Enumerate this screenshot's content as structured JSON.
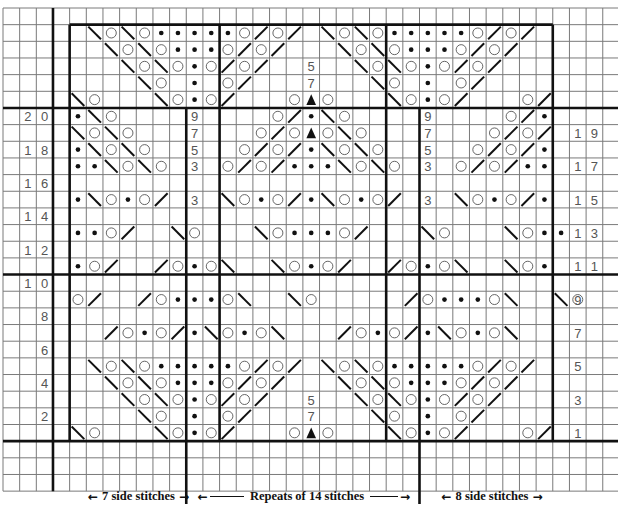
{
  "chart": {
    "cell_size": 16.66,
    "grid_origin_x": 3,
    "grid_origin_y": 8,
    "total_columns": 37,
    "total_rows": 29,
    "chart_col_start": 4,
    "chart_columns": 29,
    "chart_row_top": 1,
    "chart_rows": 26,
    "line_color": "#7a7a7a",
    "thick_line_color": "#111111",
    "symbol_color": "#111111",
    "label_color": "#555555",
    "symbol_legend": {
      ".": "empty",
      "o": "yarn-over",
      "*": "purl-dot",
      "\\": "left-slant-decrease",
      "/": "right-slant-decrease",
      "^": "triangle-double-decrease"
    },
    "rows": [
      {
        "row": 25,
        "cells": ".\\o\\o*****o/o/.\\o\\o*****o/o/."
      },
      {
        "row": 24,
        "cells": "..\\o\\o***o/o/...\\o\\o***o/o/.."
      },
      {
        "row": 23,
        "cells": "...\\o\\o*o/o/..5..\\o\\o*o/o/..."
      },
      {
        "row": 22,
        "cells": "....\\o.*.o/...7...\\o.*.o/...."
      },
      {
        "row": 21,
        "cells": "\\o...\\o*o/...o^o...\\o*o/...o/"
      },
      {
        "row": 20,
        "cells": "*\\o....9....o/*\\o....9....o/*"
      },
      {
        "row": 19,
        "cells": "\\o\\o...7...o/o^o\\o...7...o/o/"
      },
      {
        "row": 18,
        "cells": "*\\o\\o..5..o/o/*\\o\\o..5..o/o/*"
      },
      {
        "row": 17,
        "cells": "**\\o\\o.3.o/o/***\\o\\o.3.o/o/**"
      },
      {
        "row": 16,
        "cells": "............................."
      },
      {
        "row": 15,
        "cells": "*\\o*o/.3.\\o*o/*\\o*o/.3.\\o*o/*"
      },
      {
        "row": 14,
        "cells": "............................."
      },
      {
        "row": 13,
        "cells": "**o/..\\o...\\o***o/...\\o...\\o**"
      },
      {
        "row": 12,
        "cells": "............................."
      },
      {
        "row": 11,
        "cells": "*o/../o*o\\..\\o*o/../o*o\\..\\o*"
      },
      {
        "row": 10,
        "cells": "............................."
      },
      {
        "row": 9,
        "cells": "o/../o***o\\..\\o...../o***o\\..\\o"
      },
      {
        "row": 8,
        "cells": "............................."
      },
      {
        "row": 7,
        "cells": "../o*o/*\\o*o\\.../o*o/*\\o*o\\.."
      },
      {
        "row": 6,
        "cells": "............................."
      },
      {
        "row": 5,
        "cells": ".\\o\\o*****o/o/.\\o\\o*****o/o/."
      },
      {
        "row": 4,
        "cells": "..\\o\\o***o/o/...\\o\\o***o/o/.."
      },
      {
        "row": 3,
        "cells": "...\\o\\o*o/o/..5..\\o\\o*o/o/..."
      },
      {
        "row": 2,
        "cells": "....\\o.*.o/...7...\\o.*.o/...."
      },
      {
        "row": 1,
        "cells": "\\o...\\o*o/...o^o...\\o*o/...o/"
      }
    ],
    "left_row_labels": [
      {
        "row": 20,
        "text": "2 0"
      },
      {
        "row": 18,
        "text": "1 8"
      },
      {
        "row": 16,
        "text": "1 6"
      },
      {
        "row": 14,
        "text": "1 4"
      },
      {
        "row": 12,
        "text": "1 2"
      },
      {
        "row": 10,
        "text": "1 0"
      },
      {
        "row": 8,
        "text": "8"
      },
      {
        "row": 6,
        "text": "6"
      },
      {
        "row": 4,
        "text": "4"
      },
      {
        "row": 2,
        "text": "2"
      }
    ],
    "right_row_labels": [
      {
        "row": 19,
        "text": "1 9"
      },
      {
        "row": 17,
        "text": "1 7"
      },
      {
        "row": 15,
        "text": "1 5"
      },
      {
        "row": 13,
        "text": "1 3"
      },
      {
        "row": 11,
        "text": "1 1"
      },
      {
        "row": 9,
        "text": "9"
      },
      {
        "row": 7,
        "text": "7"
      },
      {
        "row": 5,
        "text": "5"
      },
      {
        "row": 3,
        "text": "3"
      },
      {
        "row": 1,
        "text": "1"
      }
    ]
  },
  "captions": {
    "left": "7 side stitches",
    "middle": "Repeats of 14 stitches",
    "right": "8 side stitches"
  }
}
